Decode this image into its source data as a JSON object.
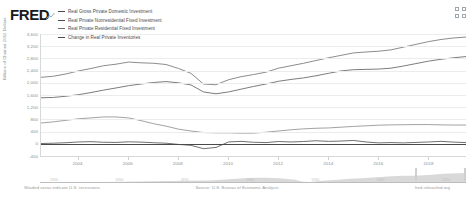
{
  "header": {
    "logo_text": "FRED",
    "logo_mark_icon": "fred-graph-mark-icon",
    "expand_icon": "expand-grid-icon"
  },
  "legend": {
    "items": [
      {
        "label": "Real Gross Private Domestic Investment",
        "color": "#4a4a4a"
      },
      {
        "label": "Real Private Nonresidential Fixed Investment",
        "color": "#4a4a4a"
      },
      {
        "label": "Real Private Residential Fixed Investment",
        "color": "#6e6e6e"
      },
      {
        "label": "Change in Real Private Inventories",
        "color": "#4a4a4a"
      }
    ]
  },
  "footer": {
    "recession_note": "Shaded areas indicate U.S. recessions",
    "source": "Source: U.S. Bureau of Economic Analysis",
    "url": "fred.stlouisfed.org"
  },
  "range_selector": {
    "ticks": [
      "1950",
      "1960",
      "1970",
      "1980",
      "1990",
      "2000",
      "2010"
    ]
  },
  "chart_data": {
    "type": "line",
    "title": "",
    "xlabel": "",
    "ylabel": "Billions of Chained 2012 Dollars",
    "xlim": [
      2002.5,
      2019.5
    ],
    "ylim": [
      -400,
      3600
    ],
    "yticks": [
      "3,600",
      "3,200",
      "2,800",
      "2,400",
      "2,000",
      "1,600",
      "1,200",
      "800",
      "400",
      "0",
      "-400"
    ],
    "ytick_values": [
      3600,
      3200,
      2800,
      2400,
      2000,
      1600,
      1200,
      800,
      400,
      0,
      -400
    ],
    "xticks": [
      "2004",
      "2006",
      "2008",
      "2010",
      "2012",
      "2014",
      "2016",
      "2018"
    ],
    "xtick_values": [
      2004,
      2006,
      2008,
      2010,
      2012,
      2014,
      2016,
      2018
    ],
    "grid": true,
    "legend_position": "top-left",
    "x": [
      2002.5,
      2003.0,
      2003.5,
      2004.0,
      2004.5,
      2005.0,
      2005.5,
      2006.0,
      2006.5,
      2007.0,
      2007.5,
      2008.0,
      2008.5,
      2009.0,
      2009.5,
      2010.0,
      2010.5,
      2011.0,
      2011.5,
      2012.0,
      2012.5,
      2013.0,
      2013.5,
      2014.0,
      2014.5,
      2015.0,
      2015.5,
      2016.0,
      2016.5,
      2017.0,
      2017.5,
      2018.0,
      2018.5,
      2019.0,
      2019.5
    ],
    "series": [
      {
        "name": "Real Gross Private Domestic Investment",
        "color": "#6f6f6f",
        "values": [
          2180,
          2215,
          2290,
          2390,
          2470,
          2560,
          2610,
          2680,
          2655,
          2640,
          2600,
          2470,
          2310,
          1960,
          1935,
          2100,
          2200,
          2270,
          2350,
          2480,
          2560,
          2640,
          2730,
          2820,
          2900,
          2980,
          3010,
          3035,
          3080,
          3170,
          3260,
          3350,
          3420,
          3470,
          3500
        ]
      },
      {
        "name": "Real Private Nonresidential Fixed Investment",
        "color": "#5a5a5a",
        "values": [
          1510,
          1520,
          1560,
          1610,
          1680,
          1760,
          1830,
          1905,
          1960,
          2010,
          2040,
          2000,
          1930,
          1700,
          1640,
          1700,
          1790,
          1880,
          1960,
          2050,
          2110,
          2160,
          2230,
          2310,
          2390,
          2430,
          2440,
          2450,
          2480,
          2550,
          2630,
          2710,
          2770,
          2820,
          2860
        ]
      },
      {
        "name": "Real Private Residential Fixed Investment",
        "color": "#8a8a8a",
        "values": [
          680,
          720,
          770,
          820,
          850,
          880,
          880,
          850,
          760,
          660,
          580,
          480,
          420,
          370,
          360,
          360,
          350,
          350,
          380,
          420,
          460,
          490,
          510,
          520,
          545,
          570,
          590,
          610,
          620,
          625,
          630,
          630,
          620,
          615,
          615
        ]
      },
      {
        "name": "Change in Real Private Inventories",
        "color": "#4a4a4a",
        "values": [
          10,
          20,
          35,
          60,
          70,
          50,
          45,
          65,
          55,
          35,
          20,
          -20,
          -50,
          -160,
          -120,
          60,
          80,
          50,
          40,
          75,
          60,
          75,
          100,
          80,
          90,
          110,
          60,
          30,
          40,
          30,
          45,
          60,
          80,
          55,
          40
        ]
      }
    ]
  }
}
